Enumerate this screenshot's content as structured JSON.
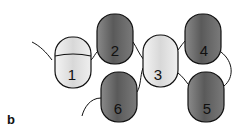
{
  "panel_label": "b",
  "colors": {
    "light": "#e6e6e6",
    "dark": "#6a6a6a",
    "outline": "#111111"
  },
  "domains": [
    {
      "label": "1",
      "shade": "light"
    },
    {
      "label": "2",
      "shade": "dark"
    },
    {
      "label": "3",
      "shade": "light"
    },
    {
      "label": "4",
      "shade": "dark"
    },
    {
      "label": "5",
      "shade": "dark"
    },
    {
      "label": "6",
      "shade": "dark"
    }
  ]
}
